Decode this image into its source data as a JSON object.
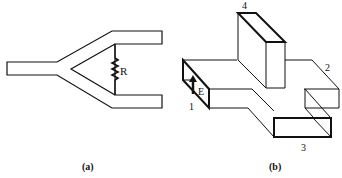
{
  "figure_a": {
    "caption": "(a)",
    "resistor_label": "R",
    "description": "Y-junction stripline power divider with resistor R between output arms"
  },
  "figure_b": {
    "caption": "(b)",
    "port_labels": [
      "1",
      "2",
      "3",
      "4"
    ],
    "field_label": "E",
    "description": "Waveguide magic tee / hybrid junction with four ports"
  },
  "colors": {
    "line": "#111111",
    "background": "#ffffff"
  }
}
